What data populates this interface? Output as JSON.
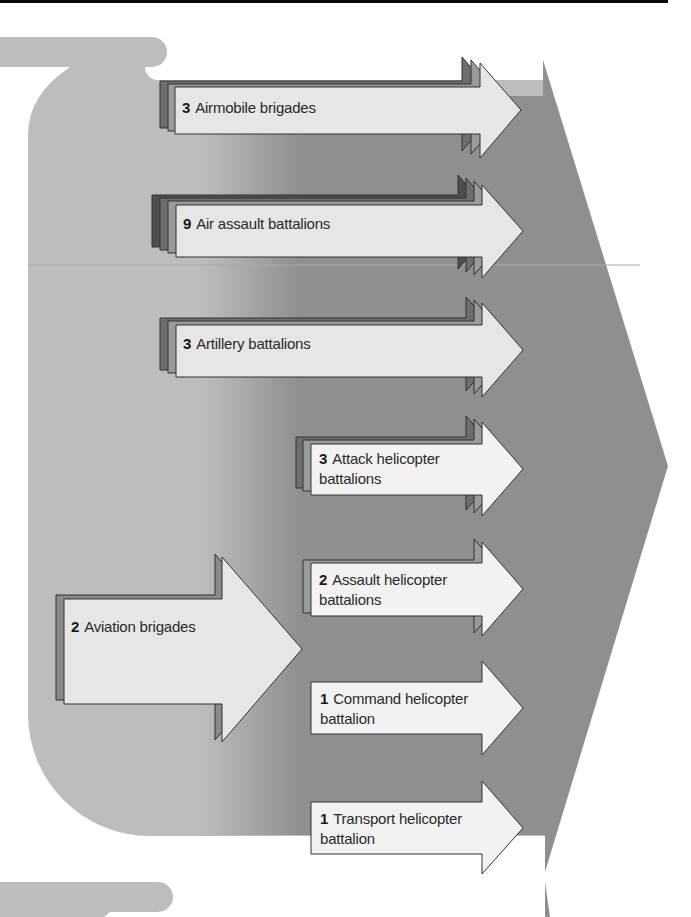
{
  "header_bar": {
    "color": "#0a0a0a"
  },
  "colors": {
    "background_blob": "#bdbdbd",
    "big_arrow": "#8f8f8f",
    "arrow_front": "#e6e6e6",
    "arrow_front_white": "#f2f2f2",
    "arrow_mid": "#9a9a9a",
    "arrow_back": "#6e6e6e",
    "outline": "#333333",
    "separator": "#a8a8a8"
  },
  "main_feed": {
    "label_count": "2",
    "label_text": "Aviation brigades"
  },
  "units": [
    {
      "count": "3",
      "line1": "Airmobile brigades",
      "line2": "",
      "layers": 3
    },
    {
      "count": "9",
      "line1": "Air assault battalions",
      "line2": "",
      "layers": 4
    },
    {
      "count": "3",
      "line1": "Artillery battalions",
      "line2": "",
      "layers": 3
    },
    {
      "count": "3",
      "line1": "Attack helicopter",
      "line2": "battalions",
      "layers": 3
    },
    {
      "count": "2",
      "line1": "Assault helicopter",
      "line2": "battalions",
      "layers": 2
    },
    {
      "count": "1",
      "line1": "Command helicopter",
      "line2": "battalion",
      "layers": 1
    },
    {
      "count": "1",
      "line1": "Transport helicopter",
      "line2": "battalion",
      "layers": 1
    }
  ]
}
